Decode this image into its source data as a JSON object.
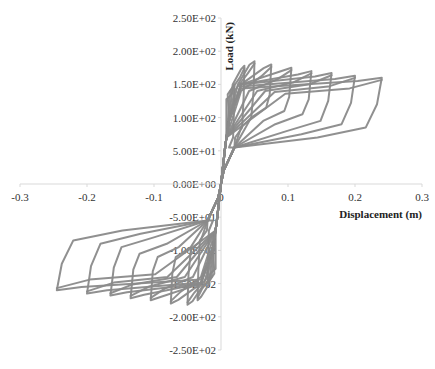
{
  "chart_data": {
    "type": "line",
    "title": "",
    "xlabel": "Displacement (m)",
    "ylabel": "Load (kN)",
    "xlim": [
      -0.3,
      0.3
    ],
    "ylim": [
      -250,
      250
    ],
    "grid": false,
    "legend": null,
    "x_ticks": [
      "-0.3",
      "-0.2",
      "-0.1",
      "0",
      "0.1",
      "0.2",
      "0.3"
    ],
    "y_ticks": [
      "2.50E+02",
      "2.00E+02",
      "1.50E+02",
      "1.00E+02",
      "5.00E+01",
      "0.00E+00",
      "-5.00E+01",
      "-1.00E+02",
      "-1.50E+02",
      "-2.00E+02",
      "-2.50E+02"
    ],
    "series_color": "#8a8a8a",
    "series": [
      {
        "name": "cycle-1",
        "peak_disp_pos": 0.02,
        "peak_load_pos": 150,
        "peak_disp_neg": -0.02,
        "peak_load_neg": -150,
        "residual_load_pos": 60,
        "residual_load_neg": -60
      },
      {
        "name": "cycle-2",
        "peak_disp_pos": 0.035,
        "peak_load_pos": 178,
        "peak_disp_neg": -0.035,
        "peak_load_neg": -175,
        "residual_load_pos": 75,
        "residual_load_neg": -75
      },
      {
        "name": "cycle-3",
        "peak_disp_pos": 0.05,
        "peak_load_pos": 185,
        "peak_disp_neg": -0.05,
        "peak_load_neg": -182,
        "residual_load_pos": 90,
        "residual_load_neg": -90
      },
      {
        "name": "cycle-4",
        "peak_disp_pos": 0.075,
        "peak_load_pos": 180,
        "peak_disp_neg": -0.075,
        "peak_load_neg": -180,
        "residual_load_pos": 105,
        "residual_load_neg": -100
      },
      {
        "name": "cycle-5",
        "peak_disp_pos": 0.105,
        "peak_load_pos": 175,
        "peak_disp_neg": -0.105,
        "peak_load_neg": -175,
        "residual_load_pos": 100,
        "residual_load_neg": -100
      },
      {
        "name": "cycle-6",
        "peak_disp_pos": 0.135,
        "peak_load_pos": 170,
        "peak_disp_neg": -0.135,
        "peak_load_neg": -172,
        "residual_load_pos": 95,
        "residual_load_neg": -95
      },
      {
        "name": "cycle-7",
        "peak_disp_pos": 0.165,
        "peak_load_pos": 167,
        "peak_disp_neg": -0.165,
        "peak_load_neg": -168,
        "residual_load_pos": 85,
        "residual_load_neg": -85
      },
      {
        "name": "cycle-8",
        "peak_disp_pos": 0.2,
        "peak_load_pos": 163,
        "peak_disp_neg": -0.2,
        "peak_load_neg": -165,
        "residual_load_pos": 80,
        "residual_load_neg": -80
      },
      {
        "name": "cycle-9",
        "peak_disp_pos": 0.24,
        "peak_load_pos": 160,
        "peak_disp_neg": -0.245,
        "peak_load_neg": -160,
        "residual_load_pos": 75,
        "residual_load_neg": -75
      }
    ]
  }
}
